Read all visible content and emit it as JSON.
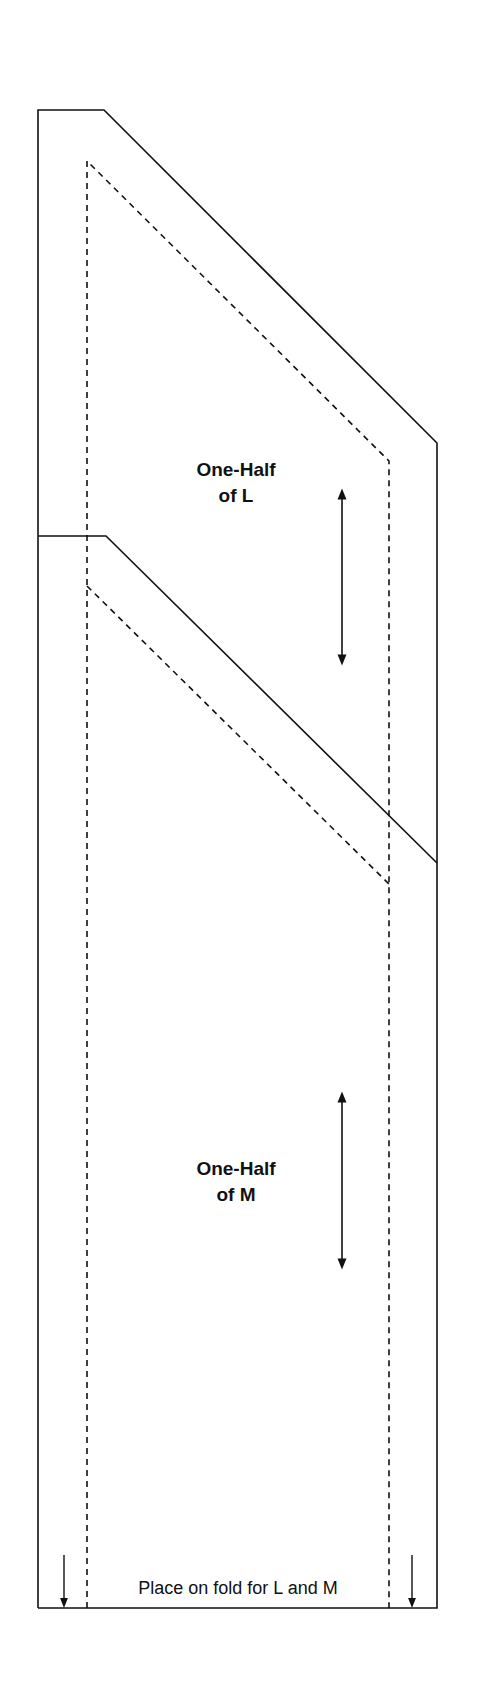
{
  "diagram": {
    "type": "sewing-pattern-piece",
    "stroke_color": "#111111",
    "background": "#ffffff",
    "pieces": [
      {
        "id": "L",
        "title_line1": "One-Half",
        "title_line2": "of L",
        "grainline": "double-arrow"
      },
      {
        "id": "M",
        "title_line1": "One-Half",
        "title_line2": "of M",
        "grainline": "double-arrow"
      }
    ],
    "fold_label": "Place on fold for L and M",
    "fold_arrows": [
      "down-arrow-left",
      "down-arrow-right"
    ],
    "line_types": {
      "cutting_line": "solid",
      "seam_line": "dashed"
    }
  }
}
